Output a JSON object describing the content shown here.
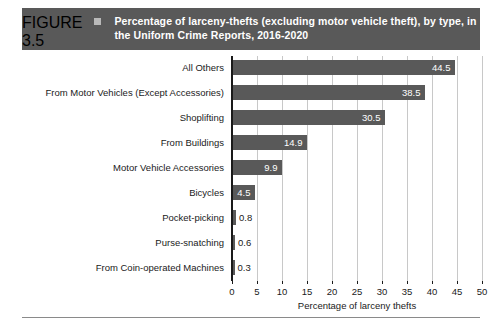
{
  "banner": {
    "figure_number": "FIGURE 3.5",
    "bullet_icon": "square-bullet-icon",
    "title": "Percentage of larceny-thefts (excluding motor vehicle theft), by type, in the Uniform Crime Reports, 2016-2020",
    "background_color": "#595959",
    "text_color": "#ffffff"
  },
  "chart_data": {
    "type": "bar",
    "orientation": "horizontal",
    "title": "Percentage of larceny-thefts (excluding motor vehicle theft), by type, in the Uniform Crime Reports, 2016-2020",
    "xlabel": "Percentage of larceny thefts",
    "ylabel": "",
    "xlim": [
      0,
      50
    ],
    "xticks": [
      0,
      5,
      10,
      15,
      20,
      25,
      30,
      35,
      40,
      45,
      50
    ],
    "xtick_labels": [
      "0",
      "5",
      "10",
      "15",
      "20",
      "25",
      "30",
      "35",
      "40",
      "45",
      "50"
    ],
    "grid": "vertical",
    "legend": "none",
    "bar_color": "#595959",
    "grid_color": "#c8c8c8",
    "categories": [
      "All Others",
      "From Motor Vehicles (Except Accessories)",
      "Shoplifting",
      "From Buildings",
      "Motor Vehicle Accessories",
      "Bicycles",
      "Pocket-picking",
      "Purse-snatching",
      "From Coin-operated Machines"
    ],
    "values": [
      44.5,
      38.5,
      30.5,
      14.9,
      9.9,
      4.5,
      0.8,
      0.6,
      0.3
    ],
    "value_labels": [
      "44.5",
      "38.5",
      "30.5",
      "14.9",
      "9.9",
      "4.5",
      "0.8",
      "0.6",
      "0.3"
    ],
    "label_placement": [
      "inside",
      "inside",
      "inside",
      "inside",
      "inside",
      "inside",
      "outside",
      "outside",
      "outside"
    ]
  }
}
